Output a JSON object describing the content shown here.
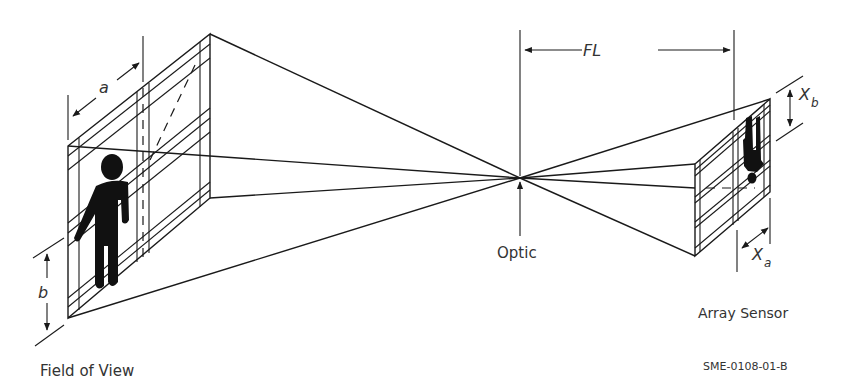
{
  "diagram": {
    "labels": {
      "field_of_view": "Field of View",
      "optic": "Optic",
      "array_sensor": "Array Sensor",
      "figure_code": "SME-0108-01-B",
      "focal_length": "FL",
      "dim_a": "a",
      "dim_b": "b",
      "dim_xb_main": "X",
      "dim_xb_sub": "b",
      "dim_xa_main": "X",
      "dim_xa_sub": "a"
    },
    "colors": {
      "line": "#1a1a1a",
      "text": "#333333",
      "background": "#ffffff"
    },
    "components": [
      "field-of-view-plane",
      "optic-point",
      "array-sensor-plane",
      "projection-rays",
      "human-figure"
    ]
  }
}
